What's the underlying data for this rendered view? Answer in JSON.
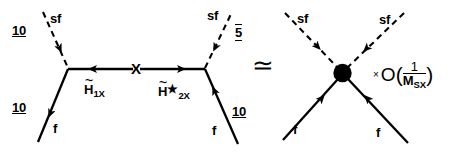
{
  "figure": {
    "relation_symbol": "≃"
  },
  "left_diagram": {
    "name": "higgsino-exchange-diagram",
    "external_lines": [
      {
        "id": "upper-left-sf",
        "particle_label": "sf",
        "rep_label": "10",
        "line_style": "dashed",
        "arrow": "inward"
      },
      {
        "id": "upper-right-sf",
        "particle_label": "sf",
        "rep_label": "5",
        "rep_overline": true,
        "line_style": "dashed",
        "arrow": "inward"
      },
      {
        "id": "lower-left-f",
        "particle_label": "f",
        "rep_label": "10",
        "line_style": "solid",
        "arrow": "inward"
      },
      {
        "id": "lower-right-f",
        "particle_label": "f",
        "rep_label": "10",
        "line_style": "solid",
        "arrow": "inward"
      }
    ],
    "propagator": {
      "mass_insertion_label": "X",
      "left_field": {
        "symbol": "H",
        "tilde": true,
        "subscript": "1X",
        "star": false
      },
      "right_field": {
        "symbol": "H",
        "tilde": true,
        "subscript": "2X",
        "star": true
      }
    }
  },
  "right_diagram": {
    "name": "effective-contact-vertex-diagram",
    "vertex_style": "filled-blob",
    "external_lines": [
      {
        "id": "upper-left-sf",
        "particle_label": "sf",
        "line_style": "dashed",
        "arrow": "inward"
      },
      {
        "id": "upper-right-sf",
        "particle_label": "sf",
        "line_style": "dashed",
        "arrow": "inward"
      },
      {
        "id": "lower-left-f",
        "particle_label": "f",
        "line_style": "solid",
        "arrow": "inward"
      },
      {
        "id": "lower-right-f",
        "particle_label": "f",
        "line_style": "solid",
        "arrow": "inward"
      }
    ],
    "order_factor": {
      "times_symbol": "×",
      "big_o": "O",
      "open_paren": "(",
      "numerator": "1",
      "denominator_symbol": "M",
      "denominator_subscript": "SX",
      "close_paren": ")"
    }
  },
  "colors": {
    "ink": "#000000",
    "background": "#ffffff"
  }
}
